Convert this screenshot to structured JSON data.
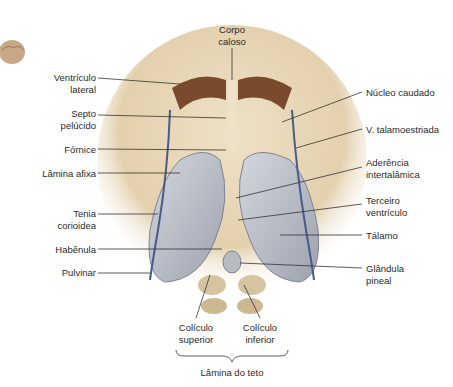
{
  "diagram": {
    "type": "anatomical illustration",
    "labels": {
      "corpo_caloso": "Corpo\ncaloso",
      "ventriculo_lateral": "Ventrículo\nlateral",
      "septo_pelucido": "Septo\npelúcido",
      "fornice": "Fórnice",
      "lamina_afixa": "Lâmina afixa",
      "tenia_corioidea": "Tenia\ncorioidea",
      "habenula": "Habênula",
      "pulvinar": "Pulvinar",
      "nucleo_caudado": "Núcleo caudado",
      "v_talamoestriada": "V. talamoestriada",
      "aderencia_intertalamica": "Aderência\nintertalâmica",
      "terceiro_ventriculo": "Terceiro\nventrículo",
      "talamo": "Tálamo",
      "glandula_pineal": "Glândula\npineal",
      "coliculo_superior": "Colículo\nsuperior",
      "coliculo_inferior": "Colículo\ninferior",
      "lamina_do_teto": "Lâmina do teto"
    },
    "colors": {
      "tissue": "#e6d6b8",
      "tissue_dark": "#c9b08a",
      "ventricle": "#7a4a2c",
      "thalamus": "#b8bcc6",
      "vein": "#4a5a8a",
      "leader": "#333333"
    }
  }
}
